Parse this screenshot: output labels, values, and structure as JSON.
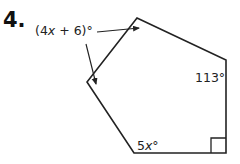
{
  "problem": {
    "number": "4.",
    "figure": "pentagon",
    "angles": [
      {
        "label": "(4x + 6)°",
        "vertex": "left",
        "parts": [
          "(4",
          "x",
          " + 6)°"
        ]
      },
      {
        "label": "113°",
        "vertex": "top-right",
        "parts": [
          "113°"
        ]
      },
      {
        "label": "5x°",
        "vertex": "bottom-left",
        "parts": [
          "5",
          "x",
          "°"
        ]
      },
      {
        "label": "right angle",
        "vertex": "bottom-right",
        "marker": "square"
      },
      {
        "label": "unlabeled",
        "vertex": "top"
      }
    ]
  },
  "colors": {
    "stroke": "#222222",
    "text": "#222222",
    "background": "#ffffff"
  }
}
